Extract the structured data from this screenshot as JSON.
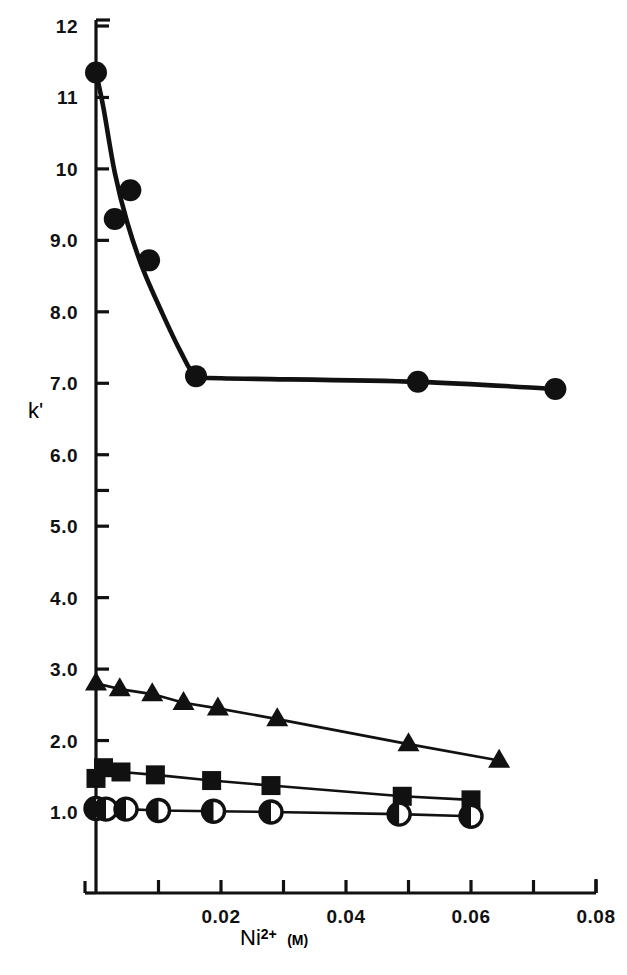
{
  "figure": {
    "background_color": "#ffffff",
    "ink_color": "#111111"
  },
  "chart_data": {
    "type": "scatter",
    "title": "",
    "subtitle": "",
    "xlabel": "Ni2+ (M)",
    "xlabel_base": "Ni",
    "xlabel_sup": "2+",
    "xlabel_unit": "(M)",
    "ylabel": "k'",
    "xlim": [
      0.0,
      0.082
    ],
    "ylim": [
      0.35,
      12.0
    ],
    "grid": false,
    "legend": "none",
    "xticks_major": [
      0.02,
      0.04,
      0.06,
      0.08
    ],
    "xtick_labels": [
      "0.02",
      "0.04",
      "0.06",
      "0.08"
    ],
    "xticks_minor": [
      0.01,
      0.03,
      0.05,
      0.07
    ],
    "yticks_major": [
      12,
      11,
      10,
      9.0,
      8.0,
      7.0,
      6.0,
      5.0,
      4.0,
      3.0,
      2.0,
      1.0
    ],
    "ytick_labels": [
      "12",
      "11",
      "10",
      "9.0",
      "8.0",
      "7.0",
      "6.0",
      "5.0",
      "4.0",
      "3.0",
      "2.0",
      "1.0"
    ],
    "yticks_minor": [
      5.5
    ],
    "series": [
      {
        "name": "filled-circle-series",
        "marker": "filled-circle",
        "line": "smooth-decay-then-plateau",
        "points": [
          {
            "x": 0.0,
            "y": 11.35
          },
          {
            "x": 0.003,
            "y": 9.3
          },
          {
            "x": 0.0055,
            "y": 9.7
          },
          {
            "x": 0.0085,
            "y": 8.72
          },
          {
            "x": 0.016,
            "y": 7.1
          },
          {
            "x": 0.0515,
            "y": 7.02
          },
          {
            "x": 0.0735,
            "y": 6.92
          }
        ],
        "curve": [
          {
            "x": 0.0,
            "y": 11.35
          },
          {
            "x": 0.0012,
            "y": 10.85
          },
          {
            "x": 0.003,
            "y": 9.95
          },
          {
            "x": 0.005,
            "y": 9.25
          },
          {
            "x": 0.0075,
            "y": 8.6
          },
          {
            "x": 0.0105,
            "y": 8.0
          },
          {
            "x": 0.0135,
            "y": 7.45
          },
          {
            "x": 0.016,
            "y": 7.1
          },
          {
            "x": 0.02,
            "y": 7.07
          },
          {
            "x": 0.0515,
            "y": 7.02
          },
          {
            "x": 0.0735,
            "y": 6.92
          }
        ]
      },
      {
        "name": "filled-triangle-series",
        "marker": "filled-triangle",
        "line": "straight",
        "points": [
          {
            "x": 0.0,
            "y": 2.8
          },
          {
            "x": 0.0038,
            "y": 2.72
          },
          {
            "x": 0.009,
            "y": 2.65
          },
          {
            "x": 0.014,
            "y": 2.53
          },
          {
            "x": 0.0195,
            "y": 2.45
          },
          {
            "x": 0.029,
            "y": 2.3
          },
          {
            "x": 0.05,
            "y": 1.95
          },
          {
            "x": 0.0645,
            "y": 1.72
          }
        ]
      },
      {
        "name": "filled-square-series",
        "marker": "filled-square",
        "line": "straight",
        "points": [
          {
            "x": 0.0,
            "y": 1.47
          },
          {
            "x": 0.0012,
            "y": 1.62
          },
          {
            "x": 0.004,
            "y": 1.56
          },
          {
            "x": 0.0095,
            "y": 1.52
          },
          {
            "x": 0.0185,
            "y": 1.44
          },
          {
            "x": 0.028,
            "y": 1.37
          },
          {
            "x": 0.049,
            "y": 1.22
          },
          {
            "x": 0.06,
            "y": 1.17
          }
        ]
      },
      {
        "name": "half-filled-circle-series",
        "marker": "half-filled-circle",
        "line": "straight",
        "points": [
          {
            "x": 0.0,
            "y": 1.05
          },
          {
            "x": 0.0016,
            "y": 1.04
          },
          {
            "x": 0.0048,
            "y": 1.04
          },
          {
            "x": 0.01,
            "y": 1.02
          },
          {
            "x": 0.0188,
            "y": 1.01
          },
          {
            "x": 0.028,
            "y": 1.0
          },
          {
            "x": 0.0485,
            "y": 0.97
          },
          {
            "x": 0.06,
            "y": 0.94
          }
        ]
      }
    ]
  }
}
